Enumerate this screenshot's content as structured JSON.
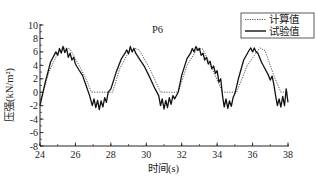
{
  "chart_data": {
    "type": "line",
    "title": "P6",
    "xlabel": "时间(s)",
    "ylabel": "压强(kN/m²)",
    "xlim": [
      24,
      38
    ],
    "ylim": [
      -8,
      10
    ],
    "xticks": [
      24,
      26,
      28,
      30,
      32,
      34,
      36,
      38
    ],
    "yticks": [
      10,
      8,
      6,
      4,
      2,
      0,
      -2,
      -4,
      -6,
      -8
    ],
    "grid": false,
    "legend_position": "upper right",
    "series": [
      {
        "name": "计算值",
        "style": "dotted",
        "color": "#555555",
        "x": [
          24.0,
          24.5,
          25.0,
          25.4,
          25.7,
          26.2,
          26.6,
          26.9,
          27.5,
          28.1,
          28.5,
          29.0,
          29.3,
          29.6,
          30.2,
          30.8,
          31.3,
          31.8,
          32.3,
          32.9,
          33.2,
          33.8,
          34.3,
          34.7,
          35.1,
          35.7,
          36.4,
          36.7,
          37.2,
          37.6,
          38.0
        ],
        "values": [
          -1.5,
          3.0,
          5.8,
          6.6,
          6.4,
          4.0,
          2.0,
          0.0,
          0.0,
          0.0,
          3.5,
          6.0,
          6.6,
          6.3,
          3.5,
          0.0,
          0.0,
          0.0,
          4.0,
          6.6,
          6.4,
          3.0,
          0.0,
          0.0,
          0.0,
          4.0,
          6.6,
          6.2,
          2.5,
          0.0,
          0.0
        ]
      },
      {
        "name": "试验值",
        "style": "solid",
        "color": "#111111",
        "x": [
          24.0,
          24.3,
          24.6,
          24.9,
          25.0,
          25.1,
          25.2,
          25.3,
          25.4,
          25.5,
          25.6,
          25.7,
          25.8,
          25.9,
          26.0,
          26.2,
          26.4,
          26.6,
          26.8,
          26.95,
          27.05,
          27.15,
          27.25,
          27.35,
          27.45,
          27.55,
          27.65,
          27.75,
          27.85,
          28.0,
          28.3,
          28.6,
          28.8,
          28.9,
          29.0,
          29.1,
          29.2,
          29.3,
          29.4,
          29.6,
          29.9,
          30.2,
          30.5,
          30.7,
          30.8,
          30.9,
          31.0,
          31.1,
          31.2,
          31.3,
          31.4,
          31.5,
          31.6,
          31.8,
          32.0,
          32.3,
          32.5,
          32.6,
          32.7,
          32.8,
          32.9,
          33.0,
          33.1,
          33.2,
          33.3,
          33.4,
          33.5,
          33.6,
          33.7,
          33.8,
          33.9,
          34.0,
          34.1,
          34.2,
          34.3,
          34.4,
          34.5,
          34.6,
          34.7,
          34.8,
          34.9,
          35.0,
          35.2,
          35.5,
          35.8,
          35.9,
          36.0,
          36.1,
          36.2,
          36.3,
          36.5,
          36.7,
          36.9,
          37.0,
          37.1,
          37.2,
          37.3,
          37.4,
          37.5,
          37.6,
          37.7,
          37.8,
          37.9,
          38.0
        ],
        "values": [
          -2.0,
          1.5,
          4.5,
          6.0,
          5.5,
          6.5,
          5.8,
          6.8,
          5.9,
          6.5,
          5.2,
          5.8,
          4.8,
          5.2,
          4.2,
          3.3,
          2.5,
          1.0,
          -0.5,
          -2.0,
          -1.0,
          -2.3,
          -1.2,
          -2.6,
          -1.3,
          -2.2,
          -0.8,
          -1.5,
          0.0,
          0.5,
          3.0,
          5.0,
          5.8,
          6.3,
          5.7,
          6.8,
          6.0,
          6.5,
          5.8,
          5.0,
          3.8,
          2.2,
          0.5,
          -0.5,
          -2.0,
          -1.0,
          -2.5,
          -1.2,
          -2.3,
          -0.8,
          -1.8,
          -0.5,
          -1.0,
          0.0,
          2.5,
          5.0,
          5.8,
          6.5,
          6.0,
          6.8,
          6.2,
          6.5,
          5.5,
          5.8,
          4.8,
          5.2,
          4.2,
          4.6,
          3.5,
          3.9,
          2.8,
          3.2,
          1.5,
          2.0,
          -0.5,
          -2.2,
          -1.0,
          -2.4,
          -1.3,
          -2.1,
          -0.8,
          -0.2,
          2.0,
          4.8,
          6.2,
          6.6,
          6.0,
          6.6,
          6.0,
          5.8,
          4.5,
          3.5,
          2.5,
          1.8,
          2.4,
          1.2,
          -0.5,
          -2.0,
          -1.0,
          -2.2,
          -0.6,
          -2.0,
          0.5,
          -1.5
        ]
      }
    ]
  },
  "labels": {
    "title": "P6",
    "xlabel": "时间(s)",
    "ylabel": "压强(kN/m²)",
    "legend_calc": "计算值",
    "legend_test": "试验值"
  }
}
